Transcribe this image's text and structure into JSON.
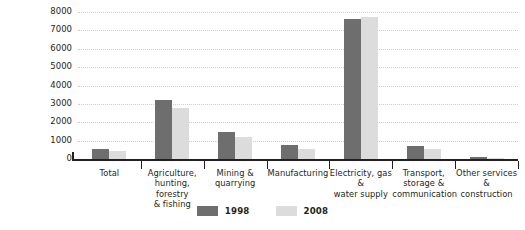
{
  "chart_data": {
    "type": "bar",
    "title": "",
    "xlabel": "",
    "ylabel": "",
    "ylim": [
      0,
      8000
    ],
    "ytick_step": 1000,
    "yticks": [
      "0",
      "1000",
      "2000",
      "3000",
      "4000",
      "5000",
      "6000",
      "7000",
      "8000"
    ],
    "grid": true,
    "grid_style": "dotted-horizontal",
    "legend_position": "bottom-center",
    "categories": [
      "Total",
      "Agriculture, hunting, forestry & fishing",
      "Mining & quarrying",
      "Manufacturing",
      "Electricity, gas & water supply",
      "Transport, storage & communication",
      "Other services & construction"
    ],
    "category_lines": [
      [
        "Total"
      ],
      [
        "Agriculture,",
        "hunting, forestry",
        "& fishing"
      ],
      [
        "Mining &",
        "quarrying"
      ],
      [
        "Manufacturing"
      ],
      [
        "Electricity, gas &",
        "water supply"
      ],
      [
        "Transport,",
        "storage &",
        "communication"
      ],
      [
        "Other services &",
        "construction"
      ]
    ],
    "series": [
      {
        "name": "1998",
        "color": "#6e6e6e",
        "values": [
          550,
          3200,
          1480,
          750,
          7600,
          720,
          90
        ]
      },
      {
        "name": "2008",
        "color": "#dcdcdc",
        "values": [
          430,
          2800,
          1220,
          530,
          7720,
          530,
          50
        ]
      }
    ]
  },
  "legend": {
    "items": [
      {
        "label": "1998",
        "color": "#6e6e6e"
      },
      {
        "label": "2008",
        "color": "#dcdcdc"
      }
    ]
  },
  "colors": {
    "series_1998": "#6e6e6e",
    "series_2008": "#dcdcdc",
    "axis": "#231f20",
    "gridline": "#cfcfcf",
    "background": "#ffffff",
    "text": "#231f20"
  }
}
